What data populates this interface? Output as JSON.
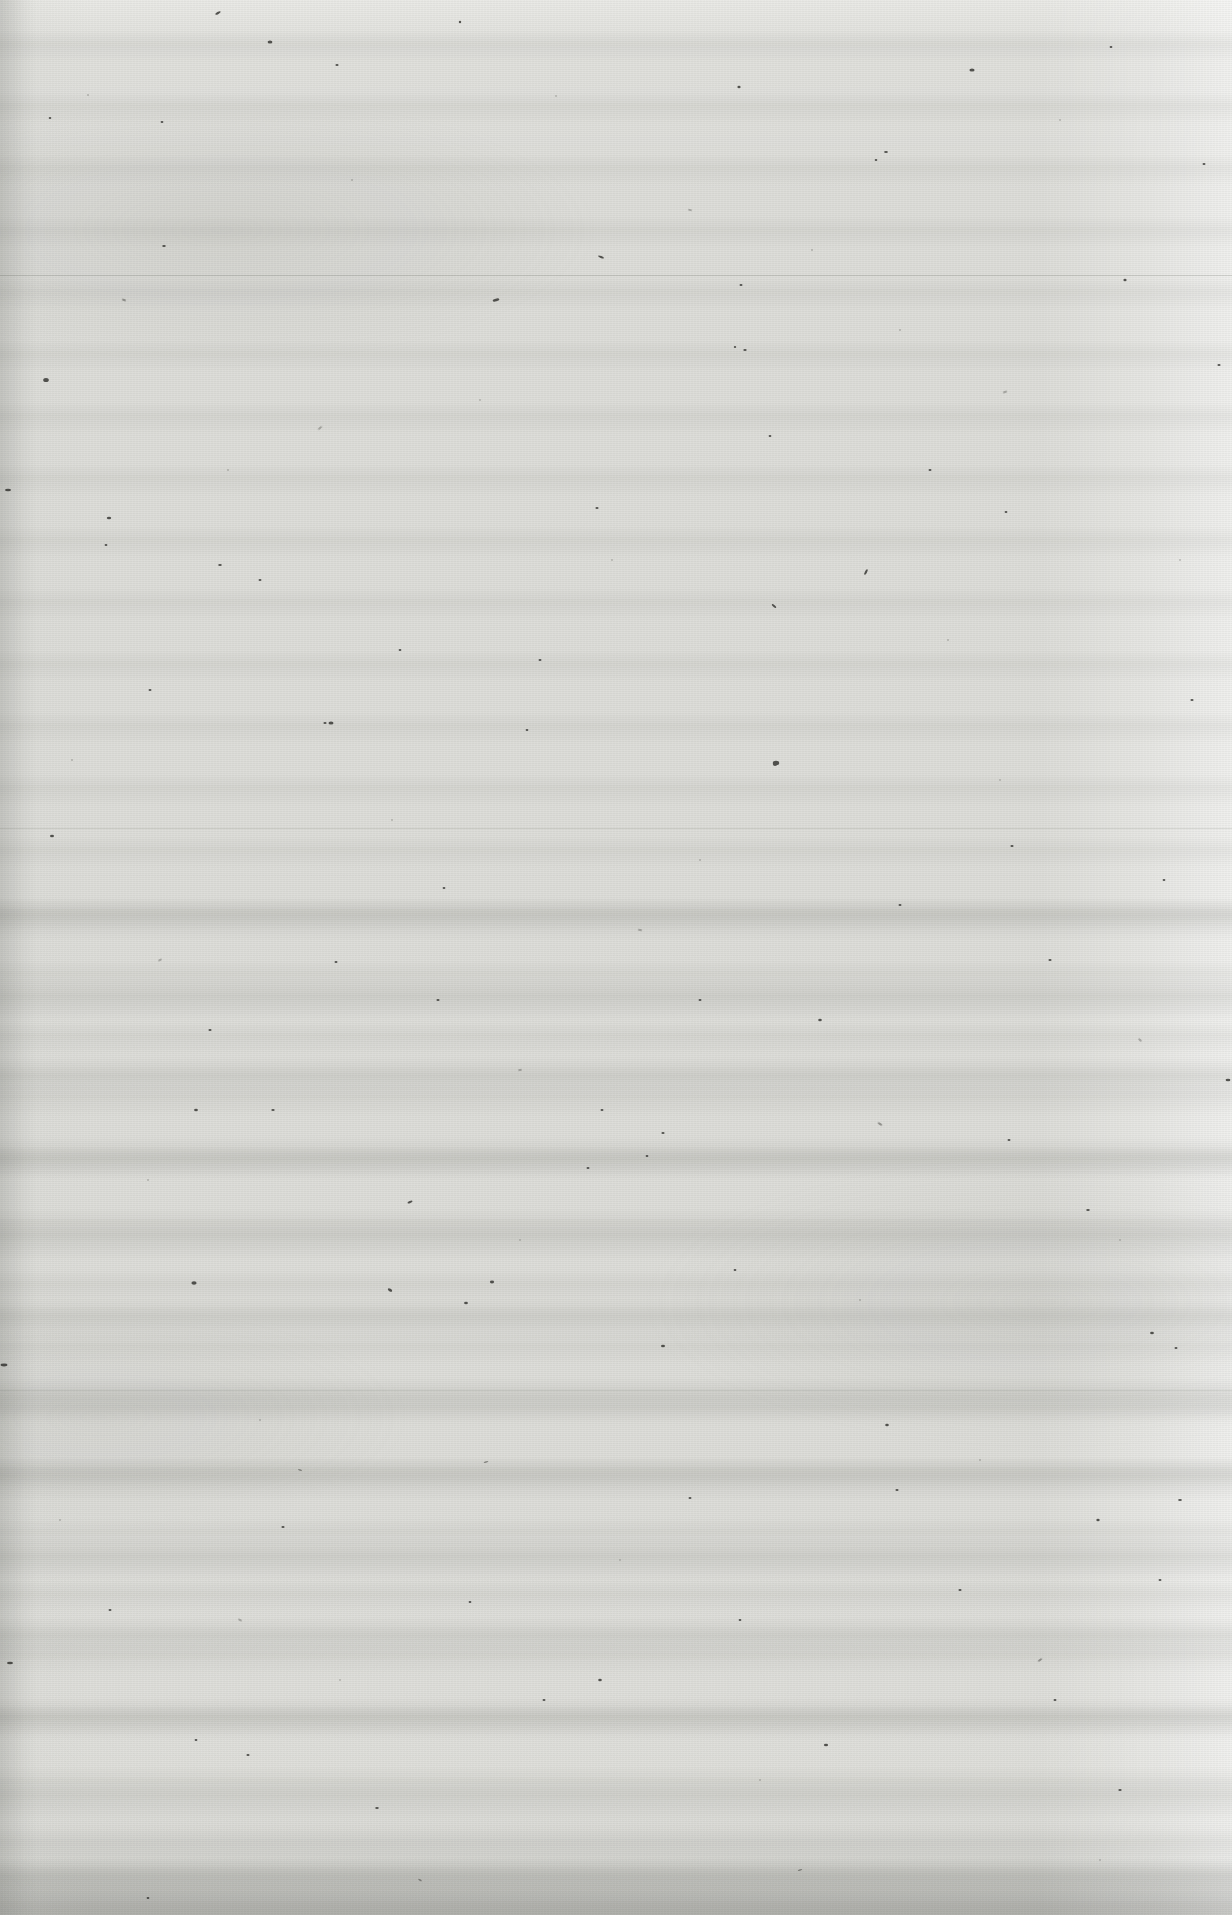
{
  "document": {
    "kind": "scanned-page",
    "content_state": "blank",
    "page_text": "",
    "width_px": 1232,
    "height_px": 1915
  },
  "appearance": {
    "paper_base_color": "#dededa",
    "paper_highlight_color": "#efefec",
    "paper_shadow_color": "#c3c4c0",
    "speck_color": "#2b2b28",
    "crease_color": "#969793",
    "bottom_edge_color": "#9a9b97",
    "right_edge_color": "#f4f4f1"
  },
  "artifacts": {
    "scanner_banding": "horizontal",
    "banding_region": "lower-two-thirds",
    "grain": "fine-paper-fiber",
    "speck_density": "sparse-random",
    "creases": [
      275,
      828,
      1390
    ],
    "edge_shadow": "bottom-and-left"
  },
  "layers": {
    "grain_label": "paper-grain",
    "banding_label": "scanner-banding",
    "blotch_label": "tonal-blotches",
    "speck_label": "foxing-specks",
    "vignette_label": "edge-vignette"
  }
}
